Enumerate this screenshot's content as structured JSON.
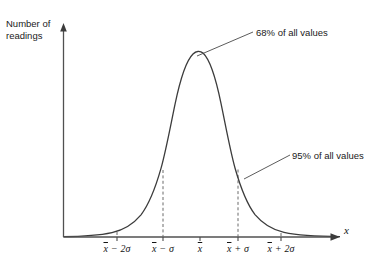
{
  "figure": {
    "axes": {
      "y_axis_label": "Number of readings",
      "x_axis_label": "x",
      "x_axis_arrow": "arrow-right",
      "y_axis_arrow": "arrow-up"
    },
    "tick_labels": [
      {
        "mean": "x",
        "operator": "−",
        "offset": "2σ",
        "x_px": 117
      },
      {
        "mean": "x",
        "operator": "−",
        "offset": "σ",
        "x_px": 163
      },
      {
        "mean": "x",
        "operator": "",
        "offset": "",
        "x_px": 200
      },
      {
        "mean": "x",
        "operator": "+",
        "offset": "σ",
        "x_px": 238
      },
      {
        "mean": "x",
        "operator": "+",
        "offset": "2σ",
        "x_px": 281
      }
    ],
    "annotations": [
      {
        "text": "68% of all values",
        "region": "cross-hatched-1-sigma"
      },
      {
        "text": "95% of all values",
        "region": "hatched-2-sigma"
      }
    ],
    "colors": {
      "curve": "#3c3c3c",
      "axis": "#505050",
      "hatch": "#4a4a4a",
      "text": "#1a1a1a",
      "background": "#ffffff"
    }
  },
  "chart_data": {
    "type": "line",
    "title": "",
    "xlabel": "x",
    "ylabel": "Number of readings",
    "grid": false,
    "legend": "none",
    "distribution": "normal",
    "mean_px": 200,
    "sigma_px": 38,
    "peak_y_px": 52,
    "baseline_y_px": 237,
    "shaded_regions": [
      {
        "label": "68% of all values",
        "from": "x̄−σ",
        "to": "x̄+σ",
        "fill": "cross-hatch",
        "percent": 68
      },
      {
        "label": "95% of all values",
        "from": "x̄−2σ",
        "to": "x̄+2σ",
        "fill": "diagonal-hatch",
        "percent": 95
      }
    ],
    "tick_values": [
      "x̄−2σ",
      "x̄−σ",
      "x̄",
      "x̄+σ",
      "x̄+2σ"
    ]
  }
}
